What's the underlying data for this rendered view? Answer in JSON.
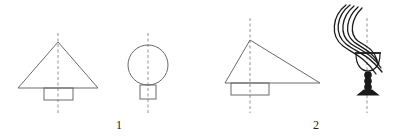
{
  "diagram": {
    "colors": {
      "stroke": "#6a6a6a",
      "axis": "#777777",
      "ink": "#1a1a1a",
      "background": "#ffffff"
    },
    "groups": [
      {
        "label": "1",
        "label_pos": {
          "x": 116,
          "y": 119
        },
        "figures": [
          {
            "name": "symmetric-triangle-on-rectangle",
            "axis": {
              "x": 58,
              "y1": 33,
              "y2": 113
            },
            "triangle": [
              [
                58,
                42
              ],
              [
                18,
                88
              ],
              [
                98,
                88
              ]
            ],
            "rect": {
              "x": 44,
              "y": 88,
              "w": 29,
              "h": 12
            }
          },
          {
            "name": "circle-on-rectangle",
            "axis": {
              "x": 148,
              "y1": 33,
              "y2": 113
            },
            "circle": {
              "cx": 148,
              "cy": 65,
              "r": 20
            },
            "rect": {
              "x": 140,
              "y": 85,
              "w": 16,
              "h": 14
            }
          }
        ]
      },
      {
        "label": "2",
        "label_pos": {
          "x": 313,
          "y": 119
        },
        "figures": [
          {
            "name": "asymmetric-triangle-on-rectangle",
            "axis": {
              "x": 250,
              "y1": 18,
              "y2": 113
            },
            "triangle": [
              [
                250,
                40
              ],
              [
                225,
                83
              ],
              [
                320,
                83
              ]
            ],
            "rect": {
              "x": 231,
              "y": 83,
              "w": 38,
              "h": 12
            }
          },
          {
            "name": "goblet-with-feathers",
            "axis": {
              "x": 367,
              "y1": 18,
              "y2": 113
            }
          }
        ]
      }
    ]
  }
}
